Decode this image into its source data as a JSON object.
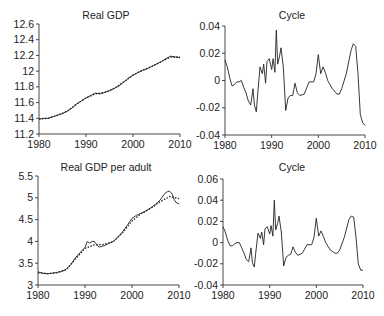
{
  "chart_data": [
    {
      "type": "line",
      "title": "Real GDP",
      "xlabel": "",
      "ylabel": "",
      "xlim": [
        1980,
        2010
      ],
      "ylim": [
        11.2,
        12.6
      ],
      "xticks": [
        "1980",
        "1990",
        "2000",
        "2010"
      ],
      "yticks": [
        "11.2",
        "11.4",
        "11.6",
        "11.8",
        "12",
        "12.2",
        "12.4",
        "12.6"
      ],
      "grid": false,
      "legend": null,
      "series": [
        {
          "name": "actual",
          "style": "solid",
          "x": [
            1980,
            1981,
            1982,
            1983,
            1984,
            1985,
            1986,
            1987,
            1988,
            1989,
            1990,
            1991,
            1992,
            1993,
            1994,
            1995,
            1996,
            1997,
            1998,
            1999,
            2000,
            2001,
            2002,
            2003,
            2004,
            2005,
            2006,
            2007,
            2008,
            2009,
            2010
          ],
          "y": [
            11.39,
            11.4,
            11.4,
            11.42,
            11.44,
            11.46,
            11.49,
            11.53,
            11.58,
            11.62,
            11.66,
            11.69,
            11.72,
            11.71,
            11.73,
            11.75,
            11.78,
            11.81,
            11.86,
            11.91,
            11.95,
            11.98,
            12.01,
            12.03,
            12.06,
            12.09,
            12.12,
            12.16,
            12.19,
            12.18,
            12.17
          ]
        },
        {
          "name": "trend",
          "style": "dotted",
          "x": [
            1980,
            1982,
            1984,
            1986,
            1988,
            1990,
            1992,
            1994,
            1996,
            1998,
            2000,
            2002,
            2004,
            2006,
            2008,
            2010
          ],
          "y": [
            11.39,
            11.4,
            11.44,
            11.49,
            11.58,
            11.66,
            11.71,
            11.73,
            11.78,
            11.86,
            11.95,
            12.01,
            12.06,
            12.12,
            12.18,
            12.18
          ]
        }
      ]
    },
    {
      "type": "line",
      "title": "Cycle",
      "xlabel": "",
      "ylabel": "",
      "xlim": [
        1980,
        2010
      ],
      "ylim": [
        -0.04,
        0.04
      ],
      "xticks": [
        "1980",
        "1990",
        "2000",
        "2010"
      ],
      "yticks": [
        "-0.04",
        "-0.02",
        "0",
        "0.02",
        "0.04"
      ],
      "grid": false,
      "legend": null,
      "series": [
        {
          "name": "cycle",
          "style": "solid",
          "x": [
            1980,
            1980.5,
            1981,
            1981.5,
            1982,
            1982.5,
            1983,
            1983.5,
            1984,
            1984.5,
            1985,
            1985.5,
            1986,
            1986.3,
            1986.7,
            1987,
            1987.5,
            1988,
            1988.3,
            1988.7,
            1989,
            1989.5,
            1990,
            1990.3,
            1990.7,
            1991,
            1991.3,
            1991.7,
            1992,
            1992.5,
            1993,
            1993.5,
            1994,
            1994.5,
            1995,
            1995.5,
            1996,
            1997,
            1998,
            1999,
            1999.5,
            2000,
            2000.5,
            2001,
            2001.5,
            2002,
            2003,
            2004,
            2004.5,
            2005,
            2006,
            2007,
            2007.5,
            2008,
            2008.5,
            2009,
            2009.5,
            2010
          ],
          "y": [
            0.015,
            0.01,
            0.002,
            -0.004,
            -0.003,
            -0.001,
            -0.001,
            0.0,
            -0.005,
            -0.009,
            -0.015,
            -0.018,
            -0.006,
            -0.018,
            -0.023,
            -0.01,
            0.01,
            0.005,
            0.012,
            -0.002,
            0.014,
            0.016,
            0.008,
            0.016,
            0.006,
            0.037,
            0.012,
            0.018,
            0.024,
            0.01,
            -0.022,
            -0.013,
            -0.011,
            -0.011,
            -0.002,
            -0.009,
            -0.011,
            -0.01,
            -0.001,
            -0.001,
            0.005,
            0.019,
            0.005,
            0.01,
            0.006,
            0.0,
            -0.006,
            -0.01,
            -0.01,
            -0.006,
            0.005,
            0.022,
            0.027,
            0.025,
            0.005,
            -0.025,
            -0.031,
            -0.033
          ]
        }
      ]
    },
    {
      "type": "line",
      "title": "Real GDP per adult",
      "xlabel": "",
      "ylabel": "",
      "xlim": [
        1980,
        2010
      ],
      "ylim": [
        3,
        5.5
      ],
      "xticks": [
        "1980",
        "1990",
        "2000",
        "2010"
      ],
      "yticks": [
        "3",
        "3.5",
        "4",
        "4.5",
        "5",
        "5.5"
      ],
      "grid": false,
      "legend": null,
      "series": [
        {
          "name": "actual",
          "style": "solid",
          "x": [
            1980,
            1981,
            1982,
            1983,
            1984,
            1985,
            1986,
            1987,
            1988,
            1989,
            1990,
            1990.5,
            1991,
            1991.5,
            1992,
            1992.5,
            1993,
            1994,
            1995,
            1996,
            1997,
            1998,
            1999,
            2000,
            2001,
            2002,
            2003,
            2004,
            2005,
            2006,
            2007,
            2007.5,
            2008,
            2008.5,
            2009,
            2009.5,
            2010
          ],
          "y": [
            3.3,
            3.27,
            3.26,
            3.27,
            3.29,
            3.31,
            3.36,
            3.47,
            3.63,
            3.75,
            3.86,
            4.0,
            3.96,
            4.0,
            4.0,
            3.92,
            3.87,
            3.9,
            3.95,
            4.0,
            4.1,
            4.22,
            4.37,
            4.53,
            4.6,
            4.65,
            4.7,
            4.77,
            4.85,
            4.95,
            5.1,
            5.14,
            5.15,
            5.1,
            4.95,
            4.88,
            4.86
          ]
        },
        {
          "name": "trend",
          "style": "dotted",
          "x": [
            1980,
            1982,
            1984,
            1986,
            1988,
            1990,
            1992,
            1994,
            1996,
            1998,
            2000,
            2002,
            2004,
            2006,
            2008,
            2010
          ],
          "y": [
            3.28,
            3.26,
            3.28,
            3.35,
            3.6,
            3.84,
            3.92,
            3.93,
            3.99,
            4.2,
            4.47,
            4.64,
            4.76,
            4.91,
            5.03,
            4.98
          ]
        }
      ]
    },
    {
      "type": "line",
      "title": "Cycle",
      "xlabel": "",
      "ylabel": "",
      "xlim": [
        1980,
        2010
      ],
      "ylim": [
        -0.04,
        0.06
      ],
      "xticks": [
        "1980",
        "1990",
        "2000",
        "2010"
      ],
      "yticks": [
        "-0.04",
        "-0.02",
        "0",
        "0.02",
        "0.04",
        "0.06"
      ],
      "grid": false,
      "legend": null,
      "series": [
        {
          "name": "cycle",
          "style": "solid",
          "x": [
            1980,
            1980.5,
            1981,
            1981.5,
            1982,
            1982.5,
            1983,
            1983.5,
            1984,
            1984.5,
            1985,
            1985.5,
            1986,
            1986.3,
            1986.7,
            1987,
            1987.5,
            1988,
            1988.3,
            1988.7,
            1989,
            1989.5,
            1990,
            1990.3,
            1990.7,
            1991,
            1991.3,
            1991.7,
            1992,
            1992.5,
            1993,
            1993.5,
            1994,
            1994.5,
            1995,
            1995.5,
            1996,
            1997,
            1998,
            1999,
            1999.5,
            2000,
            2000.5,
            2001,
            2001.5,
            2002,
            2003,
            2004,
            2004.5,
            2005,
            2006,
            2007,
            2007.5,
            2008,
            2008.5,
            2009,
            2009.5,
            2010
          ],
          "y": [
            0.015,
            0.01,
            0.002,
            -0.003,
            -0.003,
            -0.001,
            0.0,
            0.0,
            -0.005,
            -0.01,
            -0.016,
            -0.018,
            -0.005,
            -0.019,
            -0.023,
            -0.01,
            0.009,
            0.004,
            0.01,
            -0.002,
            0.013,
            0.015,
            0.008,
            0.016,
            0.006,
            0.04,
            0.012,
            0.018,
            0.025,
            0.01,
            -0.022,
            -0.014,
            -0.012,
            -0.011,
            -0.004,
            -0.009,
            -0.012,
            -0.01,
            -0.002,
            -0.002,
            0.005,
            0.023,
            0.006,
            0.011,
            0.006,
            0.0,
            -0.007,
            -0.01,
            -0.01,
            -0.007,
            0.005,
            0.022,
            0.025,
            0.024,
            0.005,
            -0.02,
            -0.026,
            -0.026
          ]
        }
      ]
    }
  ],
  "panels": [
    {
      "title": "Real GDP"
    },
    {
      "title": "Cycle"
    },
    {
      "title": "Real GDP per adult"
    },
    {
      "title": "Cycle"
    }
  ]
}
